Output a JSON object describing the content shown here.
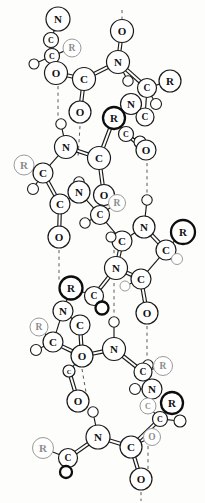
{
  "figure": {
    "kind": "chemical-structure-diagram",
    "width": 205,
    "height": 503,
    "background_color": "#fdfdfb",
    "bond_color": "#1a1a1a",
    "hydrogen_bond_color": "#5a5a5a",
    "atom_fill_color": "#ffffff"
  },
  "legend": {
    "labels": [
      "N",
      "C",
      "O",
      "R"
    ],
    "hydrogen_label": "",
    "note": ""
  },
  "chart_data": {
    "type": "scatter",
    "xlabel": "",
    "ylabel": "",
    "grid": false,
    "legend_position": "none",
    "xlim": [
      0,
      205
    ],
    "ylim": [
      0,
      503
    ],
    "atoms": [
      {
        "id": "a01",
        "label": "N",
        "x": 58,
        "y": 19,
        "r": 12.0,
        "style": "normal",
        "size": "large"
      },
      {
        "id": "a02",
        "label": "C",
        "x": 51,
        "y": 40,
        "r": 7.5,
        "style": "normal",
        "size": "small"
      },
      {
        "id": "a03",
        "label": "R",
        "x": 72,
        "y": 48,
        "r": 9.0,
        "style": "faint",
        "size": "med"
      },
      {
        "id": "a04",
        "label": "C",
        "x": 52,
        "y": 56,
        "r": 7.5,
        "style": "normal",
        "size": "small"
      },
      {
        "id": "a05",
        "label": "",
        "x": 34,
        "y": 64,
        "r": 5.0,
        "style": "h",
        "size": "h"
      },
      {
        "id": "a06",
        "label": "O",
        "x": 56,
        "y": 73,
        "r": 11.5,
        "style": "normal",
        "size": "large"
      },
      {
        "id": "a07",
        "label": "C",
        "x": 84,
        "y": 79,
        "r": 11.5,
        "style": "normal",
        "size": "large"
      },
      {
        "id": "a08",
        "label": "O",
        "x": 80,
        "y": 112,
        "r": 11.0,
        "style": "normal",
        "size": "large"
      },
      {
        "id": "a09",
        "label": "O",
        "x": 122,
        "y": 31,
        "r": 11.5,
        "style": "normal",
        "size": "large"
      },
      {
        "id": "a10",
        "label": "N",
        "x": 118,
        "y": 62,
        "r": 11.5,
        "style": "normal",
        "size": "large"
      },
      {
        "id": "a11",
        "label": "",
        "x": 128,
        "y": 81,
        "r": 5.2,
        "style": "h",
        "size": "h"
      },
      {
        "id": "a12",
        "label": "C",
        "x": 147,
        "y": 88,
        "r": 9.5,
        "style": "normal",
        "size": "med"
      },
      {
        "id": "a13",
        "label": "R",
        "x": 170,
        "y": 81,
        "r": 11.0,
        "style": "normal",
        "size": "large"
      },
      {
        "id": "a14",
        "label": "",
        "x": 156,
        "y": 104,
        "r": 5.5,
        "style": "h",
        "size": "h"
      },
      {
        "id": "a15",
        "label": "N",
        "x": 131,
        "y": 104,
        "r": 10.5,
        "style": "normal",
        "size": "large"
      },
      {
        "id": "a16",
        "label": "R",
        "x": 114,
        "y": 118,
        "r": 11.0,
        "style": "bold",
        "size": "large"
      },
      {
        "id": "a17",
        "label": "C",
        "x": 145,
        "y": 117,
        "r": 9.0,
        "style": "normal",
        "size": "med"
      },
      {
        "id": "a18",
        "label": "C",
        "x": 126,
        "y": 134,
        "r": 7.5,
        "style": "normal",
        "size": "small"
      },
      {
        "id": "a19",
        "label": "",
        "x": 140,
        "y": 142,
        "r": 6.0,
        "style": "h",
        "size": "h"
      },
      {
        "id": "a20",
        "label": "O",
        "x": 146,
        "y": 150,
        "r": 10.0,
        "style": "normal",
        "size": "large"
      },
      {
        "id": "a21",
        "label": "",
        "x": 61,
        "y": 124,
        "r": 5.2,
        "style": "h",
        "size": "h"
      },
      {
        "id": "a22",
        "label": "N",
        "x": 66,
        "y": 147,
        "r": 11.5,
        "style": "normal",
        "size": "large"
      },
      {
        "id": "a23",
        "label": "C",
        "x": 99,
        "y": 158,
        "r": 11.5,
        "style": "normal",
        "size": "large"
      },
      {
        "id": "a24",
        "label": "R",
        "x": 24,
        "y": 165,
        "r": 10.0,
        "style": "faint",
        "size": "large"
      },
      {
        "id": "a25",
        "label": "C",
        "x": 43,
        "y": 173,
        "r": 10.0,
        "style": "normal",
        "size": "large"
      },
      {
        "id": "a26",
        "label": "",
        "x": 33,
        "y": 189,
        "r": 5.5,
        "style": "h",
        "size": "h"
      },
      {
        "id": "a27",
        "label": "",
        "x": 79,
        "y": 182,
        "r": 5.2,
        "style": "h",
        "size": "h"
      },
      {
        "id": "a28",
        "label": "N",
        "x": 79,
        "y": 192,
        "r": 11.0,
        "style": "normal",
        "size": "large"
      },
      {
        "id": "a29",
        "label": "C",
        "x": 60,
        "y": 204,
        "r": 10.0,
        "style": "normal",
        "size": "large"
      },
      {
        "id": "a30",
        "label": "O",
        "x": 104,
        "y": 195,
        "r": 10.5,
        "style": "normal",
        "size": "large"
      },
      {
        "id": "a31",
        "label": "R",
        "x": 117,
        "y": 203,
        "r": 8.5,
        "style": "faint",
        "size": "med"
      },
      {
        "id": "a32",
        "label": "C",
        "x": 100,
        "y": 215,
        "r": 9.5,
        "style": "normal",
        "size": "med"
      },
      {
        "id": "a33",
        "label": "",
        "x": 85,
        "y": 223,
        "r": 5.2,
        "style": "h",
        "size": "h"
      },
      {
        "id": "a34",
        "label": "O",
        "x": 59,
        "y": 237,
        "r": 11.0,
        "style": "normal",
        "size": "large"
      },
      {
        "id": "a35",
        "label": "",
        "x": 147,
        "y": 200,
        "r": 5.2,
        "style": "h",
        "size": "h"
      },
      {
        "id": "a36",
        "label": "C",
        "x": 122,
        "y": 241,
        "r": 10.0,
        "style": "normal",
        "size": "large"
      },
      {
        "id": "a37",
        "label": "",
        "x": 111,
        "y": 237,
        "r": 5.0,
        "style": "h",
        "size": "h"
      },
      {
        "id": "a38",
        "label": "N",
        "x": 144,
        "y": 227,
        "r": 11.0,
        "style": "normal",
        "size": "large"
      },
      {
        "id": "a39",
        "label": "R",
        "x": 183,
        "y": 232,
        "r": 12.0,
        "style": "bold",
        "size": "large"
      },
      {
        "id": "a40",
        "label": "C",
        "x": 166,
        "y": 250,
        "r": 10.0,
        "style": "normal",
        "size": "large"
      },
      {
        "id": "a41",
        "label": "",
        "x": 177,
        "y": 259,
        "r": 5.5,
        "style": "faint",
        "size": "h"
      },
      {
        "id": "a42",
        "label": "N",
        "x": 116,
        "y": 268,
        "r": 11.5,
        "style": "normal",
        "size": "large"
      },
      {
        "id": "a43",
        "label": "C",
        "x": 141,
        "y": 279,
        "r": 10.0,
        "style": "normal",
        "size": "large"
      },
      {
        "id": "a44",
        "label": "",
        "x": 125,
        "y": 286,
        "r": 5.0,
        "style": "faint",
        "size": "h"
      },
      {
        "id": "a45",
        "label": "R",
        "x": 71,
        "y": 288,
        "r": 11.5,
        "style": "bold",
        "size": "large"
      },
      {
        "id": "a46",
        "label": "C",
        "x": 94,
        "y": 296,
        "r": 9.5,
        "style": "normal",
        "size": "med"
      },
      {
        "id": "a47",
        "label": "",
        "x": 102,
        "y": 308,
        "r": 6.5,
        "style": "bold",
        "size": "h"
      },
      {
        "id": "a48",
        "label": "N",
        "x": 63,
        "y": 311,
        "r": 10.0,
        "style": "normal",
        "size": "large"
      },
      {
        "id": "a49",
        "label": "O",
        "x": 147,
        "y": 313,
        "r": 11.0,
        "style": "normal",
        "size": "large"
      },
      {
        "id": "a50",
        "label": "C",
        "x": 80,
        "y": 325,
        "r": 10.0,
        "style": "normal",
        "size": "large"
      },
      {
        "id": "a51",
        "label": "R",
        "x": 39,
        "y": 327,
        "r": 9.0,
        "style": "faint",
        "size": "med"
      },
      {
        "id": "a52",
        "label": "C",
        "x": 53,
        "y": 342,
        "r": 10.0,
        "style": "normal",
        "size": "large"
      },
      {
        "id": "a53",
        "label": "",
        "x": 36,
        "y": 350,
        "r": 5.5,
        "style": "h",
        "size": "h"
      },
      {
        "id": "a54",
        "label": "O",
        "x": 82,
        "y": 356,
        "r": 11.0,
        "style": "normal",
        "size": "large"
      },
      {
        "id": "a55",
        "label": "C",
        "x": 69,
        "y": 371,
        "r": 6.0,
        "style": "normal",
        "size": "tiny"
      },
      {
        "id": "a56",
        "label": "",
        "x": 114,
        "y": 322,
        "r": 5.2,
        "style": "h",
        "size": "h"
      },
      {
        "id": "a57",
        "label": "N",
        "x": 114,
        "y": 349,
        "r": 11.5,
        "style": "normal",
        "size": "large"
      },
      {
        "id": "a58",
        "label": "",
        "x": 148,
        "y": 365,
        "r": 5.2,
        "style": "h",
        "size": "h"
      },
      {
        "id": "a59",
        "label": "C",
        "x": 143,
        "y": 372,
        "r": 9.0,
        "style": "normal",
        "size": "med"
      },
      {
        "id": "a60",
        "label": "R",
        "x": 163,
        "y": 366,
        "r": 9.5,
        "style": "faint",
        "size": "med"
      },
      {
        "id": "a61",
        "label": "",
        "x": 135,
        "y": 389,
        "r": 5.5,
        "style": "h",
        "size": "h"
      },
      {
        "id": "a62",
        "label": "N",
        "x": 152,
        "y": 389,
        "r": 10.0,
        "style": "normal",
        "size": "large"
      },
      {
        "id": "a63",
        "label": "C",
        "x": 148,
        "y": 406,
        "r": 8.0,
        "style": "faint",
        "size": "small"
      },
      {
        "id": "a64",
        "label": "R",
        "x": 172,
        "y": 403,
        "r": 11.0,
        "style": "bold",
        "size": "large"
      },
      {
        "id": "a65",
        "label": "C",
        "x": 160,
        "y": 419,
        "r": 7.5,
        "style": "normal",
        "size": "small"
      },
      {
        "id": "a66",
        "label": "",
        "x": 180,
        "y": 421,
        "r": 6.0,
        "style": "h",
        "size": "h"
      },
      {
        "id": "a67",
        "label": "O",
        "x": 78,
        "y": 401,
        "r": 11.0,
        "style": "normal",
        "size": "large"
      },
      {
        "id": "a68",
        "label": "",
        "x": 93,
        "y": 412,
        "r": 5.2,
        "style": "h",
        "size": "h"
      },
      {
        "id": "a69",
        "label": "N",
        "x": 98,
        "y": 437,
        "r": 12.0,
        "style": "normal",
        "size": "large"
      },
      {
        "id": "a70",
        "label": "R",
        "x": 43,
        "y": 448,
        "r": 10.5,
        "style": "faint",
        "size": "large"
      },
      {
        "id": "a71",
        "label": "C",
        "x": 68,
        "y": 458,
        "r": 9.5,
        "style": "normal",
        "size": "med"
      },
      {
        "id": "a72",
        "label": "",
        "x": 66,
        "y": 472,
        "r": 6.0,
        "style": "bold",
        "size": "h"
      },
      {
        "id": "a73",
        "label": "C",
        "x": 131,
        "y": 447,
        "r": 11.0,
        "style": "normal",
        "size": "large"
      },
      {
        "id": "a74",
        "label": "O",
        "x": 152,
        "y": 437,
        "r": 8.5,
        "style": "faint",
        "size": "med"
      },
      {
        "id": "a75",
        "label": "O",
        "x": 141,
        "y": 479,
        "r": 11.0,
        "style": "normal",
        "size": "large"
      }
    ],
    "bonds": [
      {
        "from": "a01",
        "to": "a02",
        "order": 1
      },
      {
        "from": "a02",
        "to": "a04",
        "order": 2
      },
      {
        "from": "a04",
        "to": "a03",
        "order": 1
      },
      {
        "from": "a04",
        "to": "a05",
        "order": 1
      },
      {
        "from": "a04",
        "to": "a06",
        "order": 1
      },
      {
        "from": "a06",
        "to": "a07",
        "order": 2
      },
      {
        "from": "a07",
        "to": "a08",
        "order": 2
      },
      {
        "from": "a07",
        "to": "a10",
        "order": 2
      },
      {
        "from": "a09",
        "to": "a10",
        "order": 2
      },
      {
        "from": "a10",
        "to": "a11",
        "order": 1
      },
      {
        "from": "a10",
        "to": "a12",
        "order": 2
      },
      {
        "from": "a12",
        "to": "a13",
        "order": 1
      },
      {
        "from": "a12",
        "to": "a14",
        "order": 1
      },
      {
        "from": "a12",
        "to": "a17",
        "order": 1
      },
      {
        "from": "a15",
        "to": "a17",
        "order": 1
      },
      {
        "from": "a15",
        "to": "a16",
        "order": 1
      },
      {
        "from": "a16",
        "to": "a18",
        "order": 1
      },
      {
        "from": "a18",
        "to": "a19",
        "order": 1
      },
      {
        "from": "a18",
        "to": "a20",
        "order": 2
      },
      {
        "from": "a16",
        "to": "a23",
        "order": 2
      },
      {
        "from": "a21",
        "to": "a22",
        "order": 1
      },
      {
        "from": "a22",
        "to": "a23",
        "order": 2
      },
      {
        "from": "a22",
        "to": "a25",
        "order": 1
      },
      {
        "from": "a24",
        "to": "a25",
        "order": 1
      },
      {
        "from": "a25",
        "to": "a26",
        "order": 1
      },
      {
        "from": "a25",
        "to": "a29",
        "order": 2
      },
      {
        "from": "a23",
        "to": "a30",
        "order": 2
      },
      {
        "from": "a27",
        "to": "a28",
        "order": 1
      },
      {
        "from": "a28",
        "to": "a29",
        "order": 1
      },
      {
        "from": "a29",
        "to": "a34",
        "order": 2
      },
      {
        "from": "a28",
        "to": "a32",
        "order": 1
      },
      {
        "from": "a30",
        "to": "a32",
        "order": 1
      },
      {
        "from": "a31",
        "to": "a32",
        "order": 1
      },
      {
        "from": "a32",
        "to": "a33",
        "order": 1
      },
      {
        "from": "a32",
        "to": "a36",
        "order": 1
      },
      {
        "from": "a36",
        "to": "a37",
        "order": 1
      },
      {
        "from": "a36",
        "to": "a38",
        "order": 1
      },
      {
        "from": "a38",
        "to": "a40",
        "order": 2
      },
      {
        "from": "a39",
        "to": "a40",
        "order": 1
      },
      {
        "from": "a40",
        "to": "a41",
        "order": 1
      },
      {
        "from": "a35",
        "to": "a38",
        "order": 1
      },
      {
        "from": "a36",
        "to": "a42",
        "order": 2
      },
      {
        "from": "a40",
        "to": "a43",
        "order": 1
      },
      {
        "from": "a42",
        "to": "a43",
        "order": 2
      },
      {
        "from": "a43",
        "to": "a44",
        "order": 1
      },
      {
        "from": "a43",
        "to": "a49",
        "order": 2
      },
      {
        "from": "a42",
        "to": "a46",
        "order": 2
      },
      {
        "from": "a45",
        "to": "a46",
        "order": 1
      },
      {
        "from": "a46",
        "to": "a47",
        "order": 1
      },
      {
        "from": "a45",
        "to": "a48",
        "order": 1
      },
      {
        "from": "a48",
        "to": "a50",
        "order": 1
      },
      {
        "from": "a48",
        "to": "a52",
        "order": 1
      },
      {
        "from": "a51",
        "to": "a52",
        "order": 1
      },
      {
        "from": "a52",
        "to": "a53",
        "order": 1
      },
      {
        "from": "a50",
        "to": "a54",
        "order": 2
      },
      {
        "from": "a52",
        "to": "a54",
        "order": 2
      },
      {
        "from": "a54",
        "to": "a55",
        "order": 1
      },
      {
        "from": "a54",
        "to": "a57",
        "order": 2
      },
      {
        "from": "a55",
        "to": "a67",
        "order": 2
      },
      {
        "from": "a56",
        "to": "a57",
        "order": 1
      },
      {
        "from": "a57",
        "to": "a59",
        "order": 2
      },
      {
        "from": "a59",
        "to": "a60",
        "order": 1
      },
      {
        "from": "a59",
        "to": "a58",
        "order": 1
      },
      {
        "from": "a59",
        "to": "a62",
        "order": 1
      },
      {
        "from": "a61",
        "to": "a62",
        "order": 1
      },
      {
        "from": "a62",
        "to": "a63",
        "order": 1
      },
      {
        "from": "a63",
        "to": "a65",
        "order": 1
      },
      {
        "from": "a64",
        "to": "a65",
        "order": 1
      },
      {
        "from": "a65",
        "to": "a66",
        "order": 1
      },
      {
        "from": "a65",
        "to": "a73",
        "order": 2
      },
      {
        "from": "a68",
        "to": "a69",
        "order": 1
      },
      {
        "from": "a69",
        "to": "a71",
        "order": 2
      },
      {
        "from": "a70",
        "to": "a71",
        "order": 1
      },
      {
        "from": "a71",
        "to": "a72",
        "order": 1
      },
      {
        "from": "a69",
        "to": "a73",
        "order": 2
      },
      {
        "from": "a73",
        "to": "a74",
        "order": 1
      },
      {
        "from": "a73",
        "to": "a75",
        "order": 2
      }
    ],
    "hydrogen_bonds": [
      {
        "x1": 58,
        "y1": 86,
        "x2": 58,
        "y2": 116
      },
      {
        "x1": 80,
        "y1": 126,
        "x2": 78,
        "y2": 158
      },
      {
        "x1": 147,
        "y1": 163,
        "x2": 147,
        "y2": 193
      },
      {
        "x1": 59,
        "y1": 250,
        "x2": 59,
        "y2": 280
      },
      {
        "x1": 114,
        "y1": 250,
        "x2": 114,
        "y2": 314
      },
      {
        "x1": 147,
        "y1": 326,
        "x2": 147,
        "y2": 358
      },
      {
        "x1": 82,
        "y1": 369,
        "x2": 88,
        "y2": 404
      },
      {
        "x1": 148,
        "y1": 446,
        "x2": 148,
        "y2": 470
      },
      {
        "x1": 141,
        "y1": 492,
        "x2": 141,
        "y2": 501
      },
      {
        "x1": 122,
        "y1": 10,
        "x2": 122,
        "y2": 19
      }
    ]
  }
}
